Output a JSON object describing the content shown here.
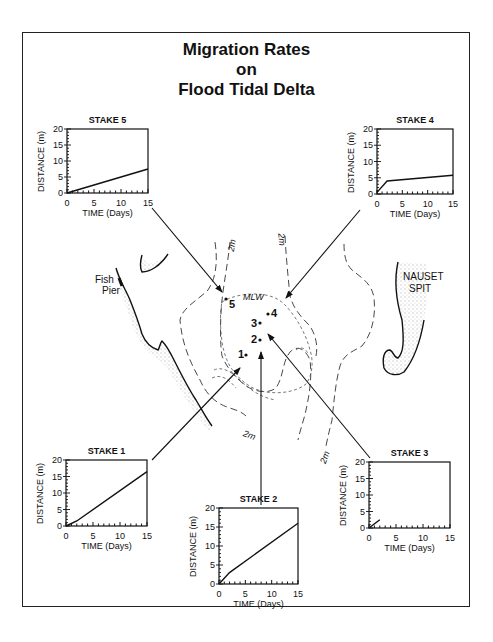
{
  "title": {
    "line1": "Migration Rates",
    "line2": "on",
    "line3": "Flood Tidal Delta"
  },
  "map": {
    "labels": {
      "fish_pier_1": "Fish",
      "fish_pier_2": "Pier",
      "nauset_1": "NAUSET",
      "nauset_2": "SPIT",
      "mlw": "MLW",
      "contour_top_left": "2m",
      "contour_top_mid": "2m",
      "contour_bottom_left": "2m",
      "contour_bottom_right": "2m"
    },
    "stakes": [
      {
        "id": "5",
        "label": "5"
      },
      {
        "id": "4",
        "label": "4"
      },
      {
        "id": "3",
        "label": "3"
      },
      {
        "id": "2",
        "label": "2"
      },
      {
        "id": "1",
        "label": "1"
      }
    ]
  },
  "axis": {
    "xlabel": "TIME (Days)",
    "ylabel": "DISTANCE (m)",
    "xticks": [
      "0",
      "5",
      "10",
      "15"
    ],
    "yticks": [
      "0",
      "5",
      "10",
      "15",
      "20"
    ]
  },
  "charts": {
    "stake5": {
      "title": "STAKE 5"
    },
    "stake4": {
      "title": "STAKE 4"
    },
    "stake1": {
      "title": "STAKE 1"
    },
    "stake2": {
      "title": "STAKE 2"
    },
    "stake3": {
      "title": "STAKE 3"
    }
  },
  "chart_data": [
    {
      "type": "line",
      "title": "STAKE 5",
      "xlabel": "TIME (Days)",
      "ylabel": "DISTANCE (m)",
      "xlim": [
        0,
        15
      ],
      "ylim": [
        0,
        20
      ],
      "xticks": [
        0,
        5,
        10,
        15
      ],
      "yticks": [
        0,
        5,
        10,
        15,
        20
      ],
      "x": [
        0,
        15
      ],
      "y": [
        0,
        7.5
      ]
    },
    {
      "type": "line",
      "title": "STAKE 4",
      "xlabel": "TIME (Days)",
      "ylabel": "DISTANCE (m)",
      "xlim": [
        0,
        15
      ],
      "ylim": [
        0,
        20
      ],
      "xticks": [
        0,
        5,
        10,
        15
      ],
      "yticks": [
        0,
        5,
        10,
        15,
        20
      ],
      "x": [
        0,
        2,
        15
      ],
      "y": [
        0.5,
        4,
        5.8
      ]
    },
    {
      "type": "line",
      "title": "STAKE 1",
      "xlabel": "TIME (Days)",
      "ylabel": "DISTANCE (m)",
      "xlim": [
        0,
        15
      ],
      "ylim": [
        0,
        20
      ],
      "xticks": [
        0,
        5,
        10,
        15
      ],
      "yticks": [
        0,
        5,
        10,
        15,
        20
      ],
      "x": [
        0,
        2,
        15
      ],
      "y": [
        0,
        1.5,
        16.5
      ]
    },
    {
      "type": "line",
      "title": "STAKE 2",
      "xlabel": "TIME (Days)",
      "ylabel": "DISTANCE (m)",
      "xlim": [
        0,
        15
      ],
      "ylim": [
        0,
        20
      ],
      "xticks": [
        0,
        5,
        10,
        15
      ],
      "yticks": [
        0,
        5,
        10,
        15,
        20
      ],
      "x": [
        0,
        2,
        15
      ],
      "y": [
        0,
        3,
        16
      ]
    },
    {
      "type": "line",
      "title": "STAKE 3",
      "xlabel": "TIME (Days)",
      "ylabel": "DISTANCE (m)",
      "xlim": [
        0,
        15
      ],
      "ylim": [
        0,
        20
      ],
      "xticks": [
        0,
        5,
        10,
        15
      ],
      "yticks": [
        0,
        5,
        10,
        15,
        20
      ],
      "x": [
        0,
        2
      ],
      "y": [
        0,
        2.5
      ]
    }
  ]
}
